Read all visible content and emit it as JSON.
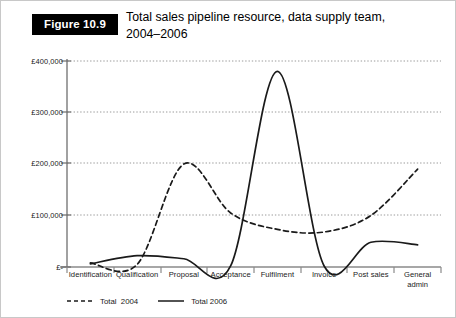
{
  "figure": {
    "badge_label": "Figure 10.9",
    "title": "Total sales pipeline resource, data supply team,\n2004–2006"
  },
  "chart_data": {
    "type": "line",
    "title": "Total sales pipeline resource, data supply team, 2004–2006",
    "xlabel": "",
    "ylabel": "",
    "ylim": [
      0,
      400000
    ],
    "yticks": [
      0,
      100000,
      200000,
      300000,
      400000
    ],
    "ytick_labels": [
      "£-",
      "£100,000",
      "£200,000",
      "£300,000",
      "£400,000"
    ],
    "grid": true,
    "legend_position": "below-left",
    "categories": [
      "Identification",
      "Qualification",
      "Proposal",
      "Acceptance",
      "Fulfilment",
      "Invoice",
      "Post sales",
      "General admin"
    ],
    "series": [
      {
        "name": "Total 2004",
        "style": "dashed",
        "color": "#1a1a1a",
        "values": [
          8000,
          5000,
          200000,
          105000,
          73000,
          68000,
          100000,
          190000
        ]
      },
      {
        "name": "Total 2006",
        "style": "solid",
        "color": "#1a1a1a",
        "values": [
          6000,
          22000,
          16000,
          2000,
          380000,
          2000,
          48000,
          43000
        ]
      }
    ]
  },
  "legend": {
    "items": [
      {
        "label": "Total  2004",
        "style": "dashed"
      },
      {
        "label": "Total 2006",
        "style": "solid"
      }
    ]
  },
  "axis": {
    "x_categories": [
      "Identification",
      "Qualification",
      "Proposal",
      "Acceptance",
      "Fulfilment",
      "Invoice",
      "Post sales",
      "General admin"
    ],
    "y_labels": [
      "£400,000",
      "£300,000",
      "£200,000",
      "£100,000",
      "£-"
    ]
  },
  "colors": {
    "line": "#1a1a1a",
    "axis": "#888888",
    "grid": "#9a9a9a",
    "badge_bg": "#000000",
    "badge_fg": "#ffffff"
  }
}
